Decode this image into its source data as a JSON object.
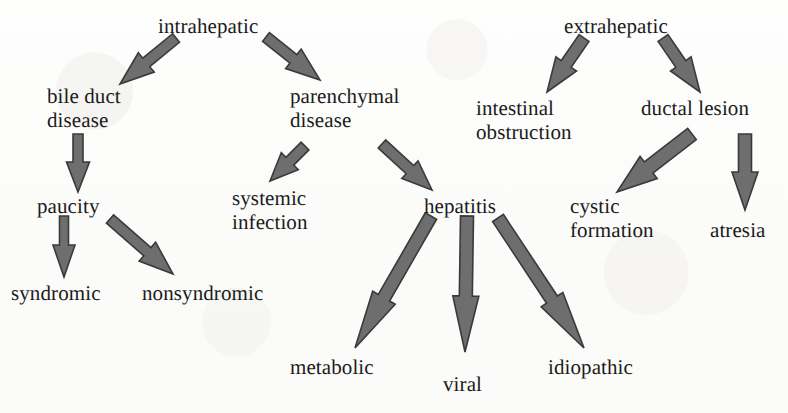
{
  "diagram": {
    "type": "tree-diagram",
    "canvas": {
      "width": 788,
      "height": 413
    },
    "style": {
      "background_color": "#fdfdfc",
      "text_color": "#1b1b1b",
      "arrow_fill": "#6e6e6e",
      "arrow_stroke": "#3a3a3a"
    },
    "nodes": [
      {
        "id": "intrahepatic",
        "lines": [
          "intrahepatic"
        ],
        "x": 158,
        "y": 14,
        "align": "left",
        "level": 0
      },
      {
        "id": "extrahepatic",
        "lines": [
          "extrahepatic"
        ],
        "x": 564,
        "y": 14,
        "align": "left",
        "level": 0
      },
      {
        "id": "bile-duct-disease",
        "lines": [
          "bile duct",
          "disease"
        ],
        "x": 47,
        "y": 84,
        "align": "left",
        "level": 1
      },
      {
        "id": "parenchymal-disease",
        "lines": [
          "parenchymal",
          "disease"
        ],
        "x": 290,
        "y": 84,
        "align": "left",
        "level": 1
      },
      {
        "id": "intestinal-obstruction",
        "lines": [
          "intestinal",
          "obstruction"
        ],
        "x": 476,
        "y": 96,
        "align": "left",
        "level": 1
      },
      {
        "id": "ductal-lesion",
        "lines": [
          "ductal lesion"
        ],
        "x": 641,
        "y": 96,
        "align": "left",
        "level": 1
      },
      {
        "id": "paucity",
        "lines": [
          "paucity"
        ],
        "x": 37,
        "y": 194,
        "align": "left",
        "level": 2
      },
      {
        "id": "systemic-infection",
        "lines": [
          "systemic",
          "infection"
        ],
        "x": 232,
        "y": 186,
        "align": "left",
        "level": 2
      },
      {
        "id": "hepatitis",
        "lines": [
          "hepatitis"
        ],
        "x": 424,
        "y": 194,
        "align": "left",
        "level": 2
      },
      {
        "id": "cystic-formation",
        "lines": [
          "cystic",
          "formation"
        ],
        "x": 570,
        "y": 194,
        "align": "left",
        "level": 2
      },
      {
        "id": "atresia",
        "lines": [
          "atresia"
        ],
        "x": 710,
        "y": 218,
        "align": "left",
        "level": 2
      },
      {
        "id": "syndromic",
        "lines": [
          "syndromic"
        ],
        "x": 11,
        "y": 281,
        "align": "left",
        "level": 3
      },
      {
        "id": "nonsyndromic",
        "lines": [
          "nonsyndromic"
        ],
        "x": 142,
        "y": 281,
        "align": "left",
        "level": 3
      },
      {
        "id": "metabolic",
        "lines": [
          "metabolic"
        ],
        "x": 290,
        "y": 355,
        "align": "left",
        "level": 3
      },
      {
        "id": "viral",
        "lines": [
          "viral"
        ],
        "x": 443,
        "y": 372,
        "align": "left",
        "level": 3
      },
      {
        "id": "idiopathic",
        "lines": [
          "idiopathic"
        ],
        "x": 548,
        "y": 355,
        "align": "left",
        "level": 3
      }
    ],
    "edges": [
      {
        "id": "intrahepatic-to-bile-duct-disease",
        "from": "intrahepatic",
        "to": "bile duct disease",
        "x1": 176,
        "y1": 38,
        "x2": 120,
        "y2": 84,
        "shaft": 11,
        "head_len": 34,
        "head_w": 25
      },
      {
        "id": "intrahepatic-to-parenchymal-disease",
        "from": "intrahepatic",
        "to": "parenchymal disease",
        "x1": 266,
        "y1": 37,
        "x2": 320,
        "y2": 80,
        "shaft": 11,
        "head_len": 34,
        "head_w": 25
      },
      {
        "id": "bile-duct-disease-to-paucity",
        "from": "bile duct disease",
        "to": "paucity",
        "x1": 78,
        "y1": 134,
        "x2": 78,
        "y2": 192,
        "shaft": 10,
        "head_len": 30,
        "head_w": 23
      },
      {
        "id": "parenchymal-disease-to-systemic-infection",
        "from": "parenchymal disease",
        "to": "systemic infection",
        "x1": 305,
        "y1": 146,
        "x2": 270,
        "y2": 181,
        "shaft": 11,
        "head_len": 28,
        "head_w": 24
      },
      {
        "id": "parenchymal-disease-to-hepatitis",
        "from": "parenchymal disease",
        "to": "hepatitis",
        "x1": 382,
        "y1": 144,
        "x2": 432,
        "y2": 190,
        "shaft": 11,
        "head_len": 30,
        "head_w": 24
      },
      {
        "id": "paucity-to-syndromic",
        "from": "paucity",
        "to": "syndromic",
        "x1": 64,
        "y1": 216,
        "x2": 64,
        "y2": 277,
        "shaft": 9,
        "head_len": 32,
        "head_w": 22
      },
      {
        "id": "paucity-to-nonsyndromic",
        "from": "paucity",
        "to": "nonsyndromic",
        "x1": 110,
        "y1": 219,
        "x2": 173,
        "y2": 274,
        "shaft": 11,
        "head_len": 34,
        "head_w": 25
      },
      {
        "id": "hepatitis-to-metabolic",
        "from": "hepatitis",
        "to": "metabolic",
        "x1": 431,
        "y1": 216,
        "x2": 355,
        "y2": 348,
        "shaft": 13,
        "head_len": 58,
        "head_w": 26
      },
      {
        "id": "hepatitis-to-viral",
        "from": "hepatitis",
        "to": "viral",
        "x1": 467,
        "y1": 216,
        "x2": 465,
        "y2": 352,
        "shaft": 13,
        "head_len": 56,
        "head_w": 26
      },
      {
        "id": "hepatitis-to-idiopathic",
        "from": "hepatitis",
        "to": "idiopathic",
        "x1": 498,
        "y1": 218,
        "x2": 584,
        "y2": 348,
        "shaft": 13,
        "head_len": 58,
        "head_w": 26
      },
      {
        "id": "extrahepatic-to-intestinal-obstruction",
        "from": "extrahepatic",
        "to": "intestinal obstruction",
        "x1": 584,
        "y1": 38,
        "x2": 547,
        "y2": 92,
        "shaft": 12,
        "head_len": 34,
        "head_w": 25
      },
      {
        "id": "extrahepatic-to-ductal-lesion",
        "from": "extrahepatic",
        "to": "ductal lesion",
        "x1": 663,
        "y1": 38,
        "x2": 700,
        "y2": 92,
        "shaft": 12,
        "head_len": 34,
        "head_w": 25
      },
      {
        "id": "ductal-lesion-to-cystic-formation",
        "from": "ductal lesion",
        "to": "cystic formation",
        "x1": 692,
        "y1": 134,
        "x2": 617,
        "y2": 192,
        "shaft": 14,
        "head_len": 40,
        "head_w": 28
      },
      {
        "id": "ductal-lesion-to-atresia",
        "from": "ductal lesion",
        "to": "atresia",
        "x1": 745,
        "y1": 134,
        "x2": 745,
        "y2": 210,
        "shaft": 13,
        "head_len": 38,
        "head_w": 26
      }
    ]
  }
}
